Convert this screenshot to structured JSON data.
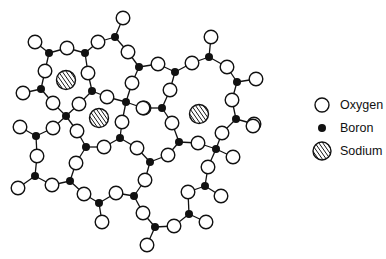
{
  "figure": {
    "title_cut_off": true
  },
  "legend": {
    "items": [
      {
        "key": "oxygen",
        "label": "Oxygen",
        "symbol": "open-circle"
      },
      {
        "key": "boron",
        "label": "Boron",
        "symbol": "filled-dot"
      },
      {
        "key": "sodium",
        "label": "Sodium",
        "symbol": "hatched-circle"
      }
    ]
  },
  "colors": {
    "stroke": "#111111",
    "oxygen_fill": "#ffffff",
    "boron_fill": "#111111",
    "background": "#ffffff"
  },
  "nodes": {
    "oxygen": [
      [
        123,
        18
      ],
      [
        211,
        37
      ],
      [
        35,
        42
      ],
      [
        67,
        48
      ],
      [
        98,
        42
      ],
      [
        128,
        52
      ],
      [
        158,
        64
      ],
      [
        192,
        63
      ],
      [
        227,
        67
      ],
      [
        256,
        79
      ],
      [
        45,
        71
      ],
      [
        88,
        73
      ],
      [
        132,
        83
      ],
      [
        170,
        90
      ],
      [
        23,
        93
      ],
      [
        53,
        103
      ],
      [
        79,
        104
      ],
      [
        107,
        97
      ],
      [
        232,
        100
      ],
      [
        144,
        108
      ],
      [
        143,
        108
      ],
      [
        172,
        123
      ],
      [
        254,
        124
      ],
      [
        20,
        127
      ],
      [
        53,
        128
      ],
      [
        77,
        131
      ],
      [
        122,
        122
      ],
      [
        37,
        156
      ],
      [
        104,
        147
      ],
      [
        137,
        148
      ],
      [
        168,
        155
      ],
      [
        198,
        143
      ],
      [
        222,
        133
      ],
      [
        233,
        157
      ],
      [
        253,
        126
      ],
      [
        76,
        163
      ],
      [
        18,
        188
      ],
      [
        52,
        185
      ],
      [
        145,
        180
      ],
      [
        208,
        167
      ],
      [
        84,
        194
      ],
      [
        116,
        193
      ],
      [
        188,
        192
      ],
      [
        221,
        196
      ],
      [
        102,
        222
      ],
      [
        143,
        213
      ],
      [
        174,
        226
      ],
      [
        206,
        222
      ],
      [
        147,
        245
      ]
    ],
    "boron": [
      [
        49,
        53
      ],
      [
        85,
        53
      ],
      [
        115,
        37
      ],
      [
        139,
        67
      ],
      [
        175,
        72
      ],
      [
        209,
        57
      ],
      [
        237,
        82
      ],
      [
        41,
        89
      ],
      [
        92,
        91
      ],
      [
        126,
        102
      ],
      [
        162,
        108
      ],
      [
        66,
        116
      ],
      [
        236,
        119
      ],
      [
        36,
        136
      ],
      [
        86,
        147
      ],
      [
        120,
        138
      ],
      [
        150,
        162
      ],
      [
        179,
        142
      ],
      [
        216,
        149
      ],
      [
        35,
        176
      ],
      [
        70,
        181
      ],
      [
        134,
        196
      ],
      [
        205,
        186
      ],
      [
        99,
        203
      ],
      [
        189,
        214
      ],
      [
        155,
        227
      ]
    ],
    "sodium": [
      [
        66,
        80
      ],
      [
        99,
        118
      ],
      [
        199,
        114
      ]
    ]
  },
  "bonds": [
    [
      [
        35,
        42
      ],
      [
        49,
        53
      ]
    ],
    [
      [
        49,
        53
      ],
      [
        67,
        48
      ]
    ],
    [
      [
        67,
        48
      ],
      [
        85,
        53
      ]
    ],
    [
      [
        85,
        53
      ],
      [
        98,
        42
      ]
    ],
    [
      [
        98,
        42
      ],
      [
        115,
        37
      ]
    ],
    [
      [
        115,
        37
      ],
      [
        123,
        18
      ]
    ],
    [
      [
        115,
        37
      ],
      [
        128,
        52
      ]
    ],
    [
      [
        128,
        52
      ],
      [
        139,
        67
      ]
    ],
    [
      [
        139,
        67
      ],
      [
        158,
        64
      ]
    ],
    [
      [
        158,
        64
      ],
      [
        175,
        72
      ]
    ],
    [
      [
        175,
        72
      ],
      [
        192,
        63
      ]
    ],
    [
      [
        192,
        63
      ],
      [
        209,
        57
      ]
    ],
    [
      [
        209,
        57
      ],
      [
        211,
        37
      ]
    ],
    [
      [
        209,
        57
      ],
      [
        227,
        67
      ]
    ],
    [
      [
        227,
        67
      ],
      [
        237,
        82
      ]
    ],
    [
      [
        237,
        82
      ],
      [
        256,
        79
      ]
    ],
    [
      [
        237,
        82
      ],
      [
        232,
        100
      ]
    ],
    [
      [
        232,
        100
      ],
      [
        236,
        119
      ]
    ],
    [
      [
        236,
        119
      ],
      [
        254,
        124
      ]
    ],
    [
      [
        139,
        67
      ],
      [
        132,
        83
      ]
    ],
    [
      [
        132,
        83
      ],
      [
        126,
        102
      ]
    ],
    [
      [
        126,
        102
      ],
      [
        143,
        108
      ]
    ],
    [
      [
        143,
        108
      ],
      [
        162,
        108
      ]
    ],
    [
      [
        162,
        108
      ],
      [
        170,
        90
      ]
    ],
    [
      [
        170,
        90
      ],
      [
        175,
        72
      ]
    ],
    [
      [
        126,
        102
      ],
      [
        107,
        97
      ]
    ],
    [
      [
        107,
        97
      ],
      [
        92,
        91
      ]
    ],
    [
      [
        49,
        53
      ],
      [
        45,
        71
      ]
    ],
    [
      [
        45,
        71
      ],
      [
        41,
        89
      ]
    ],
    [
      [
        41,
        89
      ],
      [
        23,
        93
      ]
    ],
    [
      [
        41,
        89
      ],
      [
        53,
        103
      ]
    ],
    [
      [
        53,
        103
      ],
      [
        66,
        116
      ]
    ],
    [
      [
        66,
        116
      ],
      [
        79,
        104
      ]
    ],
    [
      [
        79,
        104
      ],
      [
        92,
        91
      ]
    ],
    [
      [
        92,
        91
      ],
      [
        88,
        73
      ]
    ],
    [
      [
        88,
        73
      ],
      [
        85,
        53
      ]
    ],
    [
      [
        66,
        116
      ],
      [
        53,
        128
      ]
    ],
    [
      [
        53,
        128
      ],
      [
        36,
        136
      ]
    ],
    [
      [
        36,
        136
      ],
      [
        20,
        127
      ]
    ],
    [
      [
        36,
        136
      ],
      [
        37,
        156
      ]
    ],
    [
      [
        37,
        156
      ],
      [
        35,
        176
      ]
    ],
    [
      [
        35,
        176
      ],
      [
        18,
        188
      ]
    ],
    [
      [
        35,
        176
      ],
      [
        52,
        185
      ]
    ],
    [
      [
        52,
        185
      ],
      [
        70,
        181
      ]
    ],
    [
      [
        70,
        181
      ],
      [
        76,
        163
      ]
    ],
    [
      [
        76,
        163
      ],
      [
        86,
        147
      ]
    ],
    [
      [
        86,
        147
      ],
      [
        77,
        131
      ]
    ],
    [
      [
        77,
        131
      ],
      [
        66,
        116
      ]
    ],
    [
      [
        86,
        147
      ],
      [
        104,
        147
      ]
    ],
    [
      [
        104,
        147
      ],
      [
        120,
        138
      ]
    ],
    [
      [
        120,
        138
      ],
      [
        122,
        122
      ]
    ],
    [
      [
        122,
        122
      ],
      [
        126,
        102
      ]
    ],
    [
      [
        120,
        138
      ],
      [
        137,
        148
      ]
    ],
    [
      [
        137,
        148
      ],
      [
        150,
        162
      ]
    ],
    [
      [
        150,
        162
      ],
      [
        168,
        155
      ]
    ],
    [
      [
        168,
        155
      ],
      [
        179,
        142
      ]
    ],
    [
      [
        179,
        142
      ],
      [
        172,
        123
      ]
    ],
    [
      [
        172,
        123
      ],
      [
        162,
        108
      ]
    ],
    [
      [
        179,
        142
      ],
      [
        198,
        143
      ]
    ],
    [
      [
        198,
        143
      ],
      [
        216,
        149
      ]
    ],
    [
      [
        216,
        149
      ],
      [
        222,
        133
      ]
    ],
    [
      [
        222,
        133
      ],
      [
        236,
        119
      ]
    ],
    [
      [
        216,
        149
      ],
      [
        233,
        157
      ]
    ],
    [
      [
        216,
        149
      ],
      [
        208,
        167
      ]
    ],
    [
      [
        208,
        167
      ],
      [
        205,
        186
      ]
    ],
    [
      [
        205,
        186
      ],
      [
        221,
        196
      ]
    ],
    [
      [
        205,
        186
      ],
      [
        188,
        192
      ]
    ],
    [
      [
        188,
        192
      ],
      [
        189,
        214
      ]
    ],
    [
      [
        189,
        214
      ],
      [
        206,
        222
      ]
    ],
    [
      [
        189,
        214
      ],
      [
        174,
        226
      ]
    ],
    [
      [
        174,
        226
      ],
      [
        155,
        227
      ]
    ],
    [
      [
        155,
        227
      ],
      [
        147,
        245
      ]
    ],
    [
      [
        155,
        227
      ],
      [
        143,
        213
      ]
    ],
    [
      [
        143,
        213
      ],
      [
        134,
        196
      ]
    ],
    [
      [
        134,
        196
      ],
      [
        145,
        180
      ]
    ],
    [
      [
        145,
        180
      ],
      [
        150,
        162
      ]
    ],
    [
      [
        134,
        196
      ],
      [
        116,
        193
      ]
    ],
    [
      [
        116,
        193
      ],
      [
        99,
        203
      ]
    ],
    [
      [
        99,
        203
      ],
      [
        84,
        194
      ]
    ],
    [
      [
        84,
        194
      ],
      [
        70,
        181
      ]
    ],
    [
      [
        99,
        203
      ],
      [
        102,
        222
      ]
    ]
  ]
}
